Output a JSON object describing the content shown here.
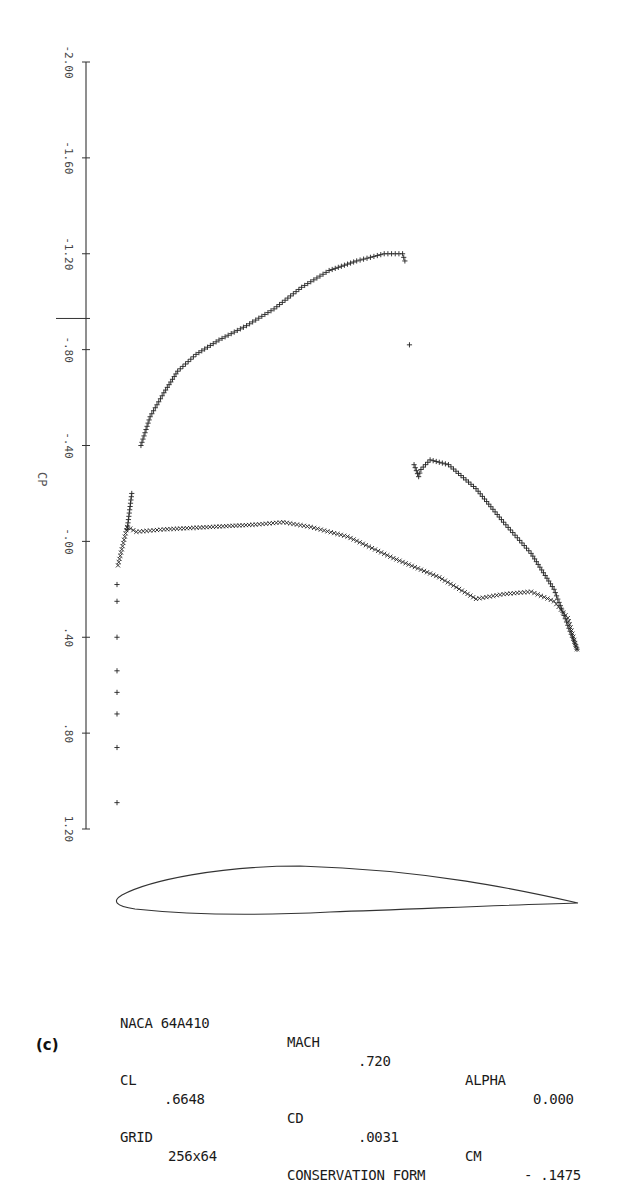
{
  "chart_data": {
    "type": "scatter",
    "title": "",
    "ylabel": "CP",
    "xlabel": "",
    "y_axis_inverted": true,
    "ylim": [
      -2.0,
      1.2
    ],
    "yticks": [
      "-2.00",
      "-1.60",
      "-1.20",
      "-.80",
      "-.40",
      "-.00",
      ".40",
      ".80",
      "1.20"
    ],
    "reference_mark": {
      "label": "critical Cp",
      "value": -0.93
    },
    "grid": false,
    "legend": null,
    "series": [
      {
        "name": "upper surface",
        "marker": "+",
        "x_chord": [
          0.02,
          0.03,
          0.05,
          0.07,
          0.1,
          0.13,
          0.17,
          0.22,
          0.28,
          0.34,
          0.4,
          0.46,
          0.52,
          0.58,
          0.62,
          0.625,
          0.635,
          0.645,
          0.655,
          0.66,
          0.68,
          0.72,
          0.78,
          0.84,
          0.9,
          0.95,
          0.98,
          1.0
        ],
        "cp": [
          -0.05,
          -0.2,
          -0.4,
          -0.52,
          -0.62,
          -0.71,
          -0.78,
          -0.84,
          -0.9,
          -0.97,
          -1.06,
          -1.13,
          -1.17,
          -1.2,
          -1.2,
          -1.17,
          -0.82,
          -0.32,
          -0.27,
          -0.3,
          -0.34,
          -0.32,
          -0.22,
          -0.08,
          0.05,
          0.2,
          0.35,
          0.45
        ]
      },
      {
        "name": "lower surface",
        "marker": "x",
        "x_chord": [
          0.0,
          0.02,
          0.04,
          0.1,
          0.2,
          0.3,
          0.36,
          0.42,
          0.5,
          0.6,
          0.7,
          0.78,
          0.84,
          0.9,
          0.95,
          0.98,
          1.0
        ],
        "cp": [
          0.1,
          -0.06,
          -0.04,
          -0.05,
          -0.06,
          -0.07,
          -0.08,
          -0.06,
          -0.02,
          0.07,
          0.15,
          0.24,
          0.22,
          0.21,
          0.25,
          0.32,
          0.45
        ]
      },
      {
        "name": "leading edge stagnation",
        "marker": "+",
        "x_chord": [
          0.0,
          0.0,
          0.0,
          0.0,
          0.0,
          0.0,
          0.0,
          0.0
        ],
        "cp": [
          0.18,
          0.25,
          0.4,
          0.54,
          0.63,
          0.72,
          0.86,
          1.09
        ]
      }
    ],
    "airfoil_outline": "NACA 64A410 profile drawn below plot",
    "annotations": [
      "CP"
    ]
  },
  "info": {
    "row1": {
      "airfoil_label": "NACA 64A410",
      "mach_label": "MACH",
      "mach_value": ".720",
      "alpha_label": "ALPHA",
      "alpha_value": "0.000"
    },
    "row2": {
      "cl_label": "CL",
      "cl_value": ".6648",
      "cd_label": "CD",
      "cd_value": ".0031",
      "cm_label": "CM",
      "cm_value": "- .1475"
    },
    "row3": {
      "grid_label": "GRID",
      "grid_value": "256x64",
      "form_label": "CONSERVATION FORM"
    }
  },
  "panel_tag": "(c)",
  "colors": {
    "ink": "#222222",
    "axis": "#333333",
    "background": "#ffffff"
  }
}
